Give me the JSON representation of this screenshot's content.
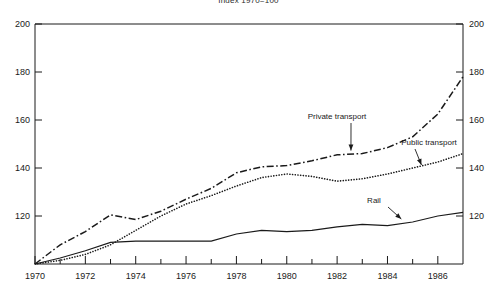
{
  "chart_data": {
    "type": "line",
    "title": "Index 1970=100",
    "xlabel": "",
    "ylabel": "",
    "xlim": [
      1970,
      1987
    ],
    "ylim": [
      100,
      200
    ],
    "grid": false,
    "legend_position": "inline-annotations",
    "x_ticks_major": [
      1970,
      1972,
      1974,
      1976,
      1978,
      1980,
      1982,
      1984,
      1986
    ],
    "x_tick_labels": [
      "1970",
      "1972",
      "1974",
      "1976",
      "1978",
      "1980",
      "1982",
      "1984",
      "1986"
    ],
    "x_ticks_minor": [
      1971,
      1973,
      1975,
      1977,
      1979,
      1981,
      1983,
      1985
    ],
    "y_ticks": [
      120,
      140,
      160,
      180,
      200
    ],
    "y_tick_labels_left": [
      "120",
      "140",
      "160",
      "180",
      "200"
    ],
    "y_tick_labels_right": [
      "120",
      "140",
      "160",
      "180",
      "200"
    ],
    "axis_left_labels": [
      "200",
      "180",
      "160",
      "140",
      "120"
    ],
    "axis_right_labels": [
      "200",
      "180",
      "160",
      "140",
      "120"
    ],
    "x": [
      1970,
      1971,
      1972,
      1973,
      1974,
      1975,
      1976,
      1977,
      1978,
      1979,
      1980,
      1981,
      1982,
      1983,
      1984,
      1985,
      1986,
      1987
    ],
    "series": [
      {
        "name": "Private transport",
        "style": "dash-dot",
        "values": [
          100,
          108,
          113.5,
          120.5,
          118.5,
          122,
          127,
          131.5,
          138,
          140.5,
          141,
          143,
          145.5,
          146,
          148.5,
          153,
          162.5,
          178
        ]
      },
      {
        "name": "Public transport",
        "style": "dotted",
        "values": [
          100,
          101.5,
          104,
          108,
          114,
          120,
          125,
          128.5,
          132.5,
          136,
          137.5,
          136.5,
          134.5,
          135.5,
          137.5,
          140,
          142.5,
          146
        ]
      },
      {
        "name": "Rail",
        "style": "solid",
        "values": [
          100,
          102.5,
          105.5,
          109,
          109.5,
          109.5,
          109.5,
          109.5,
          112.5,
          114,
          113.5,
          114,
          115.5,
          116.5,
          116,
          117.5,
          120,
          121.5
        ]
      }
    ],
    "annotations": [
      {
        "text": "Private transport",
        "target_series": "Private transport",
        "label_x": 337,
        "label_y": 119
      },
      {
        "text": "Public transport",
        "target_series": "Public transport",
        "label_x": 429,
        "label_y": 145
      },
      {
        "text": "Rail",
        "target_series": "Rail",
        "label_x": 374,
        "label_y": 203
      }
    ],
    "colors": {
      "axis": "#1a1a1a",
      "private_transport": "#1a1a1a",
      "public_transport": "#1a1a1a",
      "rail": "#1a1a1a",
      "background": "#ffffff"
    }
  }
}
